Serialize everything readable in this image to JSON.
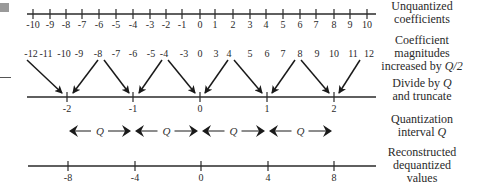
{
  "rows": {
    "unquantized": {
      "label_line1": "Unquantized",
      "label_line2": "coefficients",
      "ticks": [
        "-10",
        "-9",
        "-8",
        "-7",
        "-6",
        "-5",
        "-4",
        "-3",
        "-2",
        "-1",
        "0",
        "1",
        "2",
        "3",
        "4",
        "5",
        "6",
        "7",
        "8",
        "9",
        "10"
      ]
    },
    "increased": {
      "label_line1": "Coefficient",
      "label_line2": "magnitudes",
      "label_line3": "increased by",
      "label_q": "Q/2",
      "values": [
        "-12",
        "-11",
        "-10",
        "-9",
        "-8",
        "-7",
        "-6",
        "-5",
        "-4",
        "-3",
        "0",
        "3",
        "4",
        "5",
        "6",
        "7",
        "8",
        "9",
        "10",
        "11",
        "12"
      ]
    },
    "divide": {
      "label_line1": "Divide by",
      "label_q": "Q",
      "label_line2": "and truncate",
      "ticks": [
        "-2",
        "-1",
        "0",
        "1",
        "2"
      ]
    },
    "interval": {
      "label_line1": "Quantization",
      "label_line2": "interval",
      "label_q": "Q",
      "symbol": "Q"
    },
    "reconstructed": {
      "label_line1": "Reconstructed",
      "label_line2": "dequantized",
      "label_line3": "values",
      "ticks": [
        "-8",
        "-4",
        "0",
        "4",
        "8"
      ]
    }
  }
}
